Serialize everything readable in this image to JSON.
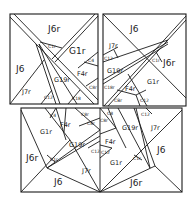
{
  "diagram": {
    "stroke_color": "#1a1a1a",
    "background": "#ffffff",
    "panels": [
      {
        "name": "top-left-panel",
        "labels": [
          {
            "text": "J6r",
            "x": 55,
            "y": 30,
            "size": "lg"
          },
          {
            "text": "J6",
            "x": 24,
            "y": 68,
            "size": "lg"
          },
          {
            "text": "G1r",
            "x": 75,
            "y": 51,
            "size": "lg"
          },
          {
            "text": "C1r",
            "x": 52,
            "y": 45,
            "size": "sm"
          },
          {
            "text": "C4",
            "x": 91,
            "y": 59,
            "size": "sm"
          },
          {
            "text": "F4r",
            "x": 82,
            "y": 73,
            "size": "md"
          },
          {
            "text": "G19r",
            "x": 57,
            "y": 79,
            "size": "md"
          },
          {
            "text": "J7r",
            "x": 29,
            "y": 91,
            "size": "md"
          },
          {
            "text": "C12",
            "x": 47,
            "y": 92,
            "size": "sm"
          },
          {
            "text": "C18",
            "x": 76,
            "y": 97,
            "size": "sm"
          },
          {
            "text": "C8r",
            "x": 91,
            "y": 86,
            "size": "sm"
          }
        ]
      },
      {
        "name": "top-right-panel",
        "labels": [
          {
            "text": "J6",
            "x": 133,
            "y": 30,
            "size": "lg"
          },
          {
            "text": "J7r",
            "x": 114,
            "y": 45,
            "size": "md"
          },
          {
            "text": "C12",
            "x": 106,
            "y": 57,
            "size": "sm"
          },
          {
            "text": "G19r",
            "x": 110,
            "y": 70,
            "size": "md"
          },
          {
            "text": "C1r",
            "x": 154,
            "y": 60,
            "size": "sm"
          },
          {
            "text": "J6r",
            "x": 166,
            "y": 64,
            "size": "lg"
          },
          {
            "text": "G1r",
            "x": 150,
            "y": 81,
            "size": "md"
          },
          {
            "text": "C18r",
            "x": 106,
            "y": 86,
            "size": "sm"
          },
          {
            "text": "F4r",
            "x": 129,
            "y": 88,
            "size": "md"
          },
          {
            "text": "CBr",
            "x": 118,
            "y": 99,
            "size": "sm"
          },
          {
            "text": "C12",
            "x": 143,
            "y": 98,
            "size": "sm"
          }
        ]
      },
      {
        "name": "bottom-panel",
        "labels": [
          {
            "text": "C4",
            "x": 52,
            "y": 115,
            "size": "sm"
          },
          {
            "text": "F4r",
            "x": 63,
            "y": 124,
            "size": "md"
          },
          {
            "text": "C8r",
            "x": 84,
            "y": 114,
            "size": "sm"
          },
          {
            "text": "C8r",
            "x": 90,
            "y": 123,
            "size": "sm"
          },
          {
            "text": "G1r",
            "x": 43,
            "y": 131,
            "size": "md"
          },
          {
            "text": "G19r",
            "x": 69,
            "y": 143,
            "size": "md"
          },
          {
            "text": "C12",
            "x": 93,
            "y": 151,
            "size": "sm"
          },
          {
            "text": "J6r",
            "x": 27,
            "y": 158,
            "size": "lg"
          },
          {
            "text": "C1r",
            "x": 53,
            "y": 158,
            "size": "sm"
          },
          {
            "text": "J7r",
            "x": 85,
            "y": 170,
            "size": "md"
          },
          {
            "text": "J6",
            "x": 57,
            "y": 182,
            "size": "lg"
          },
          {
            "text": "C8",
            "x": 110,
            "y": 113,
            "size": "sm"
          },
          {
            "text": "C8r",
            "x": 103,
            "y": 120,
            "size": "sm"
          },
          {
            "text": "G19r",
            "x": 125,
            "y": 127,
            "size": "md"
          },
          {
            "text": "C12",
            "x": 144,
            "y": 114,
            "size": "sm"
          },
          {
            "text": "J7r",
            "x": 155,
            "y": 127,
            "size": "md"
          },
          {
            "text": "F4r",
            "x": 108,
            "y": 141,
            "size": "md"
          },
          {
            "text": "C12",
            "x": 102,
            "y": 152,
            "size": "sm"
          },
          {
            "text": "J6",
            "x": 160,
            "y": 150,
            "size": "lg"
          },
          {
            "text": "G1r",
            "x": 113,
            "y": 162,
            "size": "md"
          },
          {
            "text": "C1r",
            "x": 135,
            "y": 158,
            "size": "sm"
          },
          {
            "text": "J6r",
            "x": 135,
            "y": 183,
            "size": "lg"
          }
        ]
      }
    ]
  }
}
